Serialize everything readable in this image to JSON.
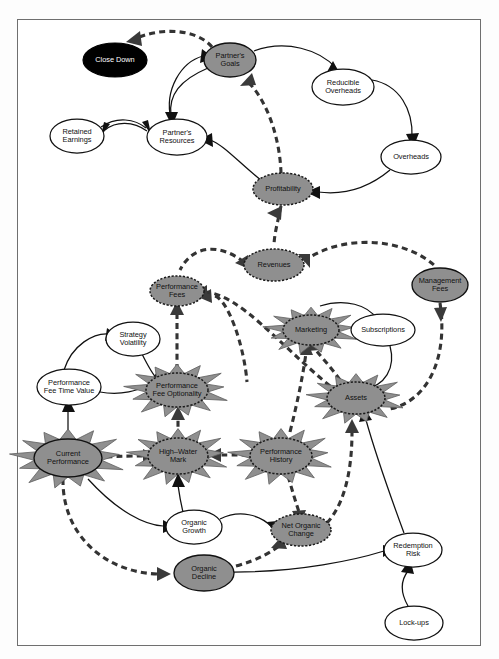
{
  "diagram": {
    "type": "causal-loop-diagram",
    "canvas": {
      "width": 499,
      "height": 659
    },
    "frame": {
      "x": 17,
      "y": 19,
      "width": 464,
      "height": 627,
      "border_color": "#6f6f6f"
    },
    "styles": {
      "plain_fill": "#ffffff",
      "gray_fill": "#8f8f8f",
      "black_fill": "#000000",
      "stroke": "#111111",
      "burst_fill": "#8f8f8f"
    },
    "nodes": [
      {
        "id": "close_down",
        "label": "Close Down",
        "lines": [
          "Close Down"
        ],
        "cx": 115,
        "cy": 60,
        "rx": 32,
        "ry": 17,
        "style": "black",
        "burst": false,
        "text": "light"
      },
      {
        "id": "partners_goals",
        "label": "Partner's Goals",
        "lines": [
          "Partner's",
          "Goals"
        ],
        "cx": 230,
        "cy": 60,
        "rx": 26,
        "ry": 17,
        "style": "gray-solid",
        "burst": false,
        "text": "dark"
      },
      {
        "id": "reducible_oh",
        "label": "Reducible Overheads",
        "lines": [
          "Reducible",
          "Overheads"
        ],
        "cx": 343,
        "cy": 87,
        "rx": 31,
        "ry": 18,
        "style": "plain",
        "burst": false,
        "text": "dark"
      },
      {
        "id": "overheads",
        "label": "Overheads",
        "lines": [
          "Overheads"
        ],
        "cx": 411,
        "cy": 157,
        "rx": 30,
        "ry": 17,
        "style": "plain",
        "burst": false,
        "text": "dark"
      },
      {
        "id": "retained_earnings",
        "label": "Retained Earnings",
        "lines": [
          "Retained",
          "Earnings"
        ],
        "cx": 77,
        "cy": 136,
        "rx": 27,
        "ry": 17,
        "style": "plain",
        "burst": false,
        "text": "dark"
      },
      {
        "id": "partners_res",
        "label": "Partner's Resources",
        "lines": [
          "Partner's",
          "Resources"
        ],
        "cx": 177,
        "cy": 137,
        "rx": 30,
        "ry": 18,
        "style": "plain",
        "burst": false,
        "text": "dark"
      },
      {
        "id": "profitability",
        "label": "Profitability",
        "lines": [
          "Profitability"
        ],
        "cx": 283,
        "cy": 189,
        "rx": 30,
        "ry": 16,
        "style": "gray-dash",
        "burst": false,
        "text": "dark"
      },
      {
        "id": "revenues",
        "label": "Revenues",
        "lines": [
          "Revenues"
        ],
        "cx": 274,
        "cy": 265,
        "rx": 30,
        "ry": 16,
        "style": "gray-dash",
        "burst": false,
        "text": "dark"
      },
      {
        "id": "management_fees",
        "label": "Management Fees",
        "lines": [
          "Management",
          "Fees"
        ],
        "cx": 440,
        "cy": 285,
        "rx": 28,
        "ry": 17,
        "style": "gray-solid",
        "burst": false,
        "text": "dark"
      },
      {
        "id": "performance_fees",
        "label": "Performance Fees",
        "lines": [
          "Performance",
          "Fees"
        ],
        "cx": 177,
        "cy": 291,
        "rx": 27,
        "ry": 15,
        "style": "gray-dash",
        "burst": false,
        "text": "dark"
      },
      {
        "id": "marketing",
        "label": "Marketing",
        "lines": [
          "Marketing"
        ],
        "cx": 311,
        "cy": 330,
        "rx": 28,
        "ry": 15,
        "style": "gray-dash",
        "burst": true,
        "text": "dark"
      },
      {
        "id": "subscriptions",
        "label": "Subscriptions",
        "lines": [
          "Subscriptions"
        ],
        "cx": 383,
        "cy": 330,
        "rx": 32,
        "ry": 16,
        "style": "plain",
        "burst": false,
        "text": "dark"
      },
      {
        "id": "strategy_vol",
        "label": "Strategy Volatility",
        "lines": [
          "Strategy",
          "Volatility"
        ],
        "cx": 133,
        "cy": 339,
        "rx": 27,
        "ry": 17,
        "style": "plain",
        "burst": false,
        "text": "dark"
      },
      {
        "id": "perf_fee_time",
        "label": "Performance Fee Time Value",
        "lines": [
          "Performance",
          "Fee Time Value"
        ],
        "cx": 69,
        "cy": 387,
        "rx": 32,
        "ry": 18,
        "style": "plain",
        "burst": false,
        "text": "dark"
      },
      {
        "id": "perf_fee_opt",
        "label": "Performance Fee Optionality",
        "lines": [
          "Performance",
          "Fee Optionality"
        ],
        "cx": 177,
        "cy": 390,
        "rx": 31,
        "ry": 17,
        "style": "gray-dash",
        "burst": true,
        "text": "dark"
      },
      {
        "id": "assets",
        "label": "Assets",
        "lines": [
          "Assets"
        ],
        "cx": 356,
        "cy": 398,
        "rx": 29,
        "ry": 16,
        "style": "gray-dash",
        "burst": true,
        "text": "dark"
      },
      {
        "id": "current_perf",
        "label": "Current Performance",
        "lines": [
          "Current",
          "Performance"
        ],
        "cx": 68,
        "cy": 458,
        "rx": 34,
        "ry": 19,
        "style": "gray-solid",
        "burst": true,
        "text": "dark"
      },
      {
        "id": "high_water",
        "label": "High-Water Mark",
        "lines": [
          "High–Water",
          "Mark"
        ],
        "cx": 178,
        "cy": 456,
        "rx": 30,
        "ry": 18,
        "style": "gray-dash",
        "burst": true,
        "text": "dark"
      },
      {
        "id": "perf_history",
        "label": "Performance History",
        "lines": [
          "Performance",
          "History"
        ],
        "cx": 281,
        "cy": 456,
        "rx": 31,
        "ry": 18,
        "style": "gray-dash",
        "burst": true,
        "text": "dark"
      },
      {
        "id": "organic_growth",
        "label": "Organic Growth",
        "lines": [
          "Organic",
          "Growth"
        ],
        "cx": 194,
        "cy": 527,
        "rx": 28,
        "ry": 17,
        "style": "plain",
        "burst": false,
        "text": "dark"
      },
      {
        "id": "net_organic",
        "label": "Net Organic Change",
        "lines": [
          "Net Organic",
          "Change"
        ],
        "cx": 301,
        "cy": 530,
        "rx": 30,
        "ry": 16,
        "style": "gray-dash",
        "burst": false,
        "text": "dark"
      },
      {
        "id": "organic_decline",
        "label": "Organic Decline",
        "lines": [
          "Organic",
          "Decline"
        ],
        "cx": 204,
        "cy": 573,
        "rx": 30,
        "ry": 18,
        "style": "gray-solid",
        "burst": false,
        "text": "dark"
      },
      {
        "id": "redemption_risk",
        "label": "Redemption Risk",
        "lines": [
          "Redemption",
          "Risk"
        ],
        "cx": 413,
        "cy": 550,
        "rx": 29,
        "ry": 17,
        "style": "plain",
        "burst": false,
        "text": "dark"
      },
      {
        "id": "lock_ups",
        "label": "Lock-ups",
        "lines": [
          "Lock-ups"
        ],
        "cx": 414,
        "cy": 623,
        "rx": 29,
        "ry": 17,
        "style": "plain",
        "burst": false,
        "text": "dark"
      }
    ],
    "edges": [
      {
        "from": "partners_goals",
        "to": "close_down",
        "kind": "dashed"
      },
      {
        "from": "partners_goals",
        "to": "reducible_oh",
        "kind": "solid"
      },
      {
        "from": "reducible_oh",
        "to": "overheads",
        "kind": "solid"
      },
      {
        "from": "overheads",
        "to": "profitability",
        "kind": "solid"
      },
      {
        "from": "partners_res",
        "to": "partners_goals",
        "kind": "solid"
      },
      {
        "from": "retained_earnings",
        "to": "partners_res",
        "kind": "solid"
      },
      {
        "from": "partners_res",
        "to": "retained_earnings",
        "kind": "solid"
      },
      {
        "from": "profitability",
        "to": "partners_res",
        "kind": "solid"
      },
      {
        "from": "profitability",
        "to": "partners_goals",
        "kind": "dashed"
      },
      {
        "from": "profitability",
        "to": "revenues",
        "kind": "dashed"
      },
      {
        "from": "revenues",
        "to": "performance_fees",
        "kind": "dashed"
      },
      {
        "from": "revenues",
        "to": "management_fees",
        "kind": "dashed"
      },
      {
        "from": "performance_fees",
        "to": "revenues",
        "kind": "dashed"
      },
      {
        "from": "management_fees",
        "to": "assets",
        "kind": "dashed"
      },
      {
        "from": "perf_fee_opt",
        "to": "performance_fees",
        "kind": "dashed"
      },
      {
        "from": "assets",
        "to": "performance_fees",
        "kind": "dashed"
      },
      {
        "from": "marketing",
        "to": "subscriptions",
        "kind": "solid"
      },
      {
        "from": "subscriptions",
        "to": "assets",
        "kind": "solid"
      },
      {
        "from": "assets",
        "to": "marketing",
        "kind": "dashed"
      },
      {
        "from": "perf_history",
        "to": "marketing",
        "kind": "dashed"
      },
      {
        "from": "strategy_vol",
        "to": "perf_fee_opt",
        "kind": "solid"
      },
      {
        "from": "perf_fee_time",
        "to": "strategy_vol",
        "kind": "solid"
      },
      {
        "from": "perf_fee_time",
        "to": "perf_fee_opt",
        "kind": "solid"
      },
      {
        "from": "current_perf",
        "to": "perf_fee_time",
        "kind": "solid"
      },
      {
        "from": "current_perf",
        "to": "high_water",
        "kind": "dashed"
      },
      {
        "from": "high_water",
        "to": "perf_fee_opt",
        "kind": "dashed"
      },
      {
        "from": "perf_history",
        "to": "high_water",
        "kind": "dashed"
      },
      {
        "from": "current_perf",
        "to": "organic_growth",
        "kind": "solid"
      },
      {
        "from": "current_perf",
        "to": "organic_decline",
        "kind": "dashed"
      },
      {
        "from": "organic_growth",
        "to": "high_water",
        "kind": "solid"
      },
      {
        "from": "organic_growth",
        "to": "net_organic",
        "kind": "solid"
      },
      {
        "from": "organic_decline",
        "to": "net_organic",
        "kind": "dashed"
      },
      {
        "from": "perf_history",
        "to": "net_organic",
        "kind": "dashed"
      },
      {
        "from": "net_organic",
        "to": "assets",
        "kind": "dashed"
      },
      {
        "from": "organic_decline",
        "to": "redemption_risk",
        "kind": "solid"
      },
      {
        "from": "redemption_risk",
        "to": "assets",
        "kind": "solid"
      },
      {
        "from": "lock_ups",
        "to": "redemption_risk",
        "kind": "solid"
      }
    ]
  }
}
